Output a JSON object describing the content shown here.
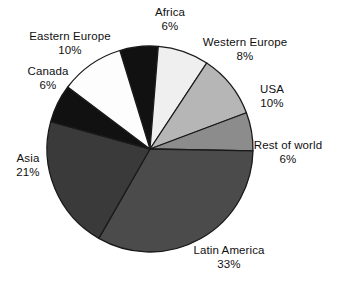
{
  "chart_data": {
    "type": "pie",
    "title": "",
    "subtitle": "",
    "xlabel": "",
    "ylabel": "",
    "legend_position": "none",
    "grid": false,
    "start_angle_deg": -17,
    "direction": "clockwise",
    "center": {
      "x": 150,
      "y": 149
    },
    "radius": 103,
    "labels_show_percent": true,
    "categories": [
      "Africa",
      "Western Europe",
      "USA",
      "Rest of world",
      "Latin America",
      "Asia",
      "Canada",
      "Eastern Europe"
    ],
    "values": [
      6,
      8,
      10,
      6,
      33,
      21,
      6,
      10
    ],
    "percent_labels": [
      "6%",
      "8%",
      "10%",
      "6%",
      "33%",
      "21%",
      "6%",
      "10%"
    ],
    "colors": [
      "#111111",
      "#efefef",
      "#b6b6b6",
      "#8c8c8c",
      "#4b4b4b",
      "#3a3a3a",
      "#111111",
      "#fdfdfd"
    ],
    "slice_border_color": "#1a1a1a",
    "slices": [
      {
        "name": "Africa",
        "value": 6,
        "percent": "6%",
        "color": "#111111"
      },
      {
        "name": "Western Europe",
        "value": 8,
        "percent": "8%",
        "color": "#efefef"
      },
      {
        "name": "USA",
        "value": 10,
        "percent": "10%",
        "color": "#b6b6b6"
      },
      {
        "name": "Rest of world",
        "value": 6,
        "percent": "6%",
        "color": "#8c8c8c"
      },
      {
        "name": "Latin America",
        "value": 33,
        "percent": "33%",
        "color": "#4b4b4b"
      },
      {
        "name": "Asia",
        "value": 21,
        "percent": "21%",
        "color": "#3a3a3a"
      },
      {
        "name": "Canada",
        "value": 6,
        "percent": "6%",
        "color": "#111111"
      },
      {
        "name": "Eastern Europe",
        "value": 10,
        "percent": "10%",
        "color": "#fdfdfd"
      }
    ]
  },
  "labels": {
    "africa": {
      "name": "Africa",
      "percent": "6%"
    },
    "western_europe": {
      "name": "Western Europe",
      "percent": "8%"
    },
    "usa": {
      "name": "USA",
      "percent": "10%"
    },
    "rest_of_world": {
      "name": "Rest of world",
      "percent": "6%"
    },
    "latin_america": {
      "name": "Latin America",
      "percent": "33%"
    },
    "asia": {
      "name": "Asia",
      "percent": "21%"
    },
    "canada": {
      "name": "Canada",
      "percent": "6%"
    },
    "eastern_europe": {
      "name": "Eastern Europe",
      "percent": "10%"
    }
  }
}
